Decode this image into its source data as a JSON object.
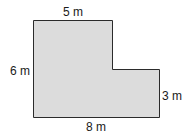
{
  "figure": {
    "type": "L-shaped polygon",
    "fill_color": "#d9d9d9",
    "stroke_color": "#2b2b2b",
    "labels": {
      "top": "5 m",
      "left": "6 m",
      "right": "3 m",
      "bottom": "8 m"
    }
  }
}
